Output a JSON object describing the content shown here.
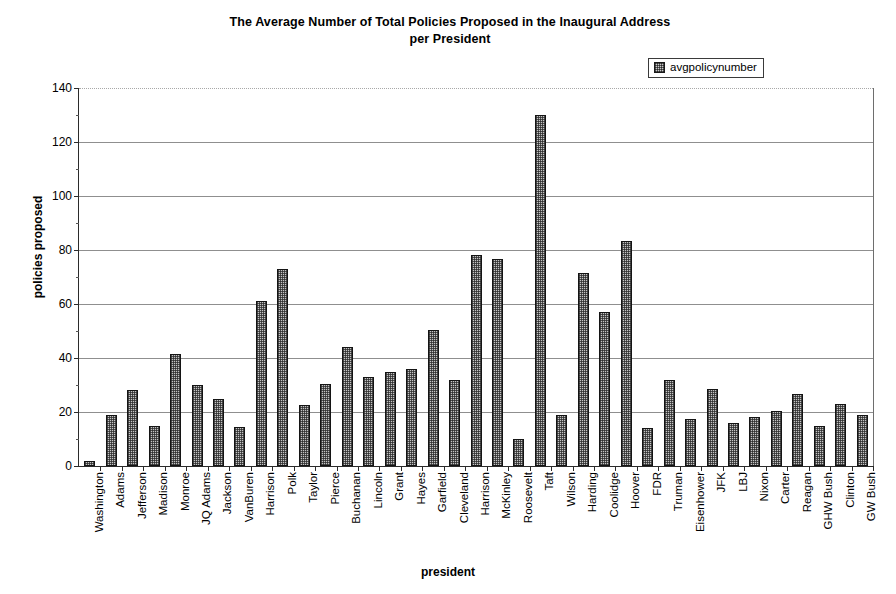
{
  "chart_data": {
    "type": "bar",
    "title": "The Average Number of Total Policies Proposed in the Inaugural Address per President",
    "title_line1": "The Average Number of Total Policies Proposed in the Inaugural Address",
    "title_line2": "per President",
    "xlabel": "president",
    "ylabel": "policies proposed",
    "ylim": [
      0,
      140
    ],
    "yticks": [
      0,
      20,
      40,
      60,
      80,
      100,
      120,
      140
    ],
    "grid": true,
    "legend": {
      "position": "top-right",
      "entries": [
        "avgpolicynumber"
      ]
    },
    "series_name": "avgpolicynumber",
    "categories": [
      "Washington",
      "Adams",
      "Jefferson",
      "Madison",
      "Monroe",
      "JQ Adams",
      "Jackson",
      "VanBuren",
      "Harrison",
      "Polk",
      "Taylor",
      "Pierce",
      "Buchanan",
      "Lincoln",
      "Grant",
      "Hayes",
      "Garfield",
      "Cleveland",
      "Harrison",
      "McKinley",
      "Roosevelt",
      "Taft",
      "Wilson",
      "Harding",
      "Coolidge",
      "Hoover",
      "FDR",
      "Truman",
      "Eisenhower",
      "JFK",
      "LBJ",
      "Nixon",
      "Carter",
      "Reagan",
      "GHW Bush",
      "Clinton",
      "GW Bush"
    ],
    "values": [
      2,
      19,
      28,
      15,
      41.5,
      30,
      25,
      14.5,
      61,
      73,
      22.5,
      30.5,
      44,
      33,
      35,
      36,
      50.5,
      32,
      78,
      76.5,
      10,
      130,
      19,
      71.5,
      57,
      83.5,
      14,
      32,
      17.5,
      28.5,
      16,
      18,
      20.5,
      26.5,
      15,
      23,
      19
    ],
    "colors": {
      "bar_fill": "#c4c4c4",
      "bar_outline": "#141414",
      "gridline": "#8f8f8f",
      "axis": "#2b2b2b",
      "text": "#000000",
      "background": "#ffffff"
    }
  }
}
